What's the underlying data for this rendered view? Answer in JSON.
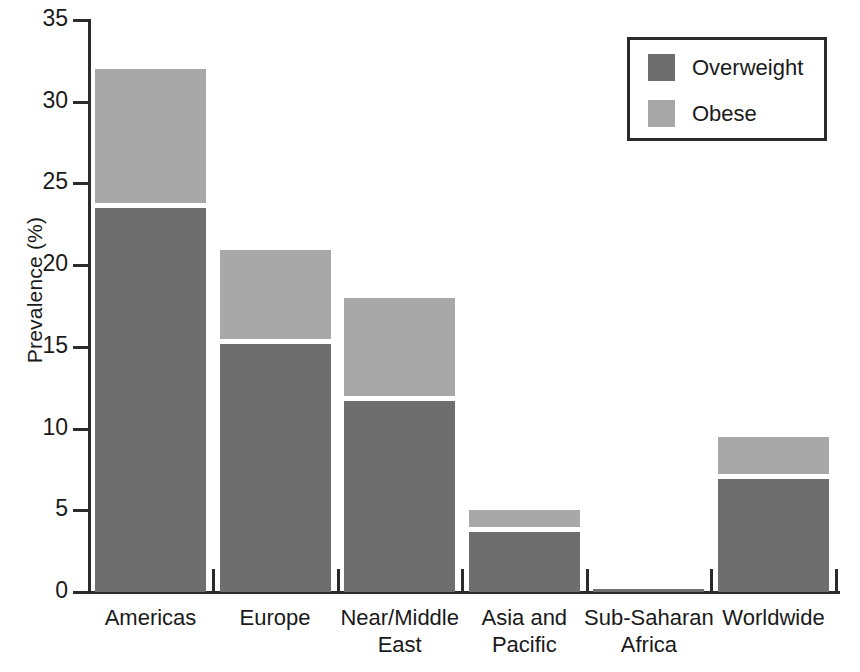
{
  "chart_data": {
    "type": "bar",
    "subtype": "stacked-bar",
    "title": "",
    "xlabel": "",
    "ylabel": "Prevalence (%)",
    "ylim": [
      0,
      35
    ],
    "yticks": [
      0,
      5,
      10,
      15,
      20,
      25,
      30,
      35
    ],
    "grid": false,
    "legend_position": "top-right",
    "categories": [
      "Americas",
      "Europe",
      "Near/Middle\nEast",
      "Asia and\nPacific",
      "Sub-Saharan\nAfrica",
      "Worldwide"
    ],
    "series": [
      {
        "name": "Overweight",
        "color": "#6e6e6e",
        "values": [
          23.5,
          15.2,
          11.7,
          3.7,
          0.2,
          6.9
        ]
      },
      {
        "name": "Obese",
        "color": "#a8a8a8",
        "values": [
          8.2,
          5.4,
          6.0,
          1.0,
          0.0,
          2.3
        ]
      }
    ],
    "totals": [
      31.7,
      20.6,
      17.7,
      4.7,
      0.2,
      9.2
    ]
  },
  "axis": {
    "y_title": "Prevalence (%)",
    "y_tick_labels": [
      "0",
      "5",
      "10",
      "15",
      "20",
      "25",
      "30",
      "35"
    ]
  },
  "legend": {
    "entries": [
      {
        "label": "Overweight",
        "color": "#6e6e6e"
      },
      {
        "label": "Obese",
        "color": "#a8a8a8"
      }
    ]
  },
  "colors": {
    "overweight": "#6e6e6e",
    "obese": "#a8a8a8",
    "axis": "#2b2b2b",
    "background": "#ffffff"
  }
}
